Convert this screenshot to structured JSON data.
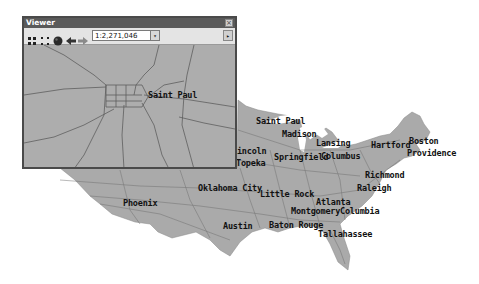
{
  "window": {
    "title": "Viewer",
    "close_label": "×",
    "toolbar": {
      "tools": [
        {
          "name": "zoom-full-extent-icon"
        },
        {
          "name": "zoom-to-layer-icon"
        },
        {
          "name": "globe-icon"
        },
        {
          "name": "back-arrow-icon"
        },
        {
          "name": "forward-arrow-icon"
        }
      ],
      "scale_value": "1:2,271,046",
      "scale_dropdown_glyph": "▾",
      "more_glyph": "▸"
    },
    "map_label": "Saint Paul"
  },
  "map": {
    "land_color": "#aaaaaa",
    "road_color": "#6e6e6e",
    "water_color": "#ffffff",
    "cities": [
      {
        "name": "Saint Paul",
        "x": 256,
        "y": 117
      },
      {
        "name": "Madison",
        "x": 282,
        "y": 130
      },
      {
        "name": "Lansing",
        "x": 316,
        "y": 139
      },
      {
        "name": "Hartford",
        "x": 371,
        "y": 141
      },
      {
        "name": "Boston",
        "x": 409,
        "y": 137
      },
      {
        "name": "Providence",
        "x": 407,
        "y": 149
      },
      {
        "name": "Lincoln",
        "x": 232,
        "y": 147
      },
      {
        "name": "Topeka",
        "x": 236,
        "y": 159
      },
      {
        "name": "Springfield",
        "x": 274,
        "y": 153
      },
      {
        "name": "Columbus",
        "x": 321,
        "y": 152
      },
      {
        "name": "Richmond",
        "x": 365,
        "y": 171
      },
      {
        "name": "Raleigh",
        "x": 357,
        "y": 184
      },
      {
        "name": "Oklahoma City",
        "x": 198,
        "y": 184
      },
      {
        "name": "Little Rock",
        "x": 260,
        "y": 190
      },
      {
        "name": "Atlanta",
        "x": 316,
        "y": 198
      },
      {
        "name": "Phoenix",
        "x": 123,
        "y": 199
      },
      {
        "name": "Montgomery",
        "x": 291,
        "y": 207
      },
      {
        "name": "Columbia",
        "x": 340,
        "y": 207
      },
      {
        "name": "Austin",
        "x": 223,
        "y": 222
      },
      {
        "name": "Baton Rouge",
        "x": 269,
        "y": 221
      },
      {
        "name": "Tallahassee",
        "x": 318,
        "y": 230
      }
    ]
  }
}
